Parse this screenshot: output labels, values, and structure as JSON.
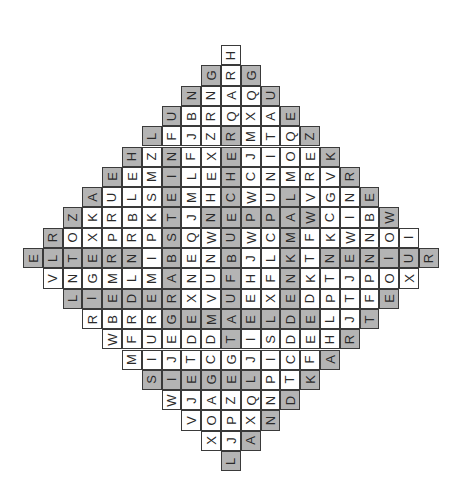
{
  "puzzle": {
    "type": "word-search-diamond",
    "rows": 21,
    "cols": 21,
    "letter_rotation_deg": -90,
    "colors": {
      "cell_bg": "#ffffff",
      "highlight_bg": "#b4b4b4",
      "border": "#3a3a3a",
      "text": "#2a2a2a"
    },
    "grid": [
      {
        "start": 10,
        "letters": "H",
        "hl": [
          0
        ]
      },
      {
        "start": 9,
        "letters": "GRG",
        "hl": [
          1,
          0,
          1
        ]
      },
      {
        "start": 8,
        "letters": "NNAQU",
        "hl": [
          1,
          0,
          0,
          0,
          1
        ]
      },
      {
        "start": 7,
        "letters": "UBRQXAE",
        "hl": [
          1,
          0,
          0,
          0,
          0,
          0,
          1
        ]
      },
      {
        "start": 6,
        "letters": "LFJZRMTQZ",
        "hl": [
          1,
          0,
          0,
          0,
          1,
          0,
          0,
          0,
          1
        ]
      },
      {
        "start": 5,
        "letters": "HZNFXEJIOEK",
        "hl": [
          1,
          0,
          1,
          0,
          0,
          1,
          0,
          0,
          0,
          0,
          1
        ]
      },
      {
        "start": 4,
        "letters": "EEMILEHCNMRVR",
        "hl": [
          1,
          0,
          0,
          1,
          0,
          0,
          1,
          0,
          0,
          0,
          0,
          0,
          1
        ]
      },
      {
        "start": 3,
        "letters": "AULSEMHCWULVGNE",
        "hl": [
          1,
          0,
          0,
          0,
          1,
          0,
          0,
          1,
          0,
          0,
          1,
          0,
          0,
          0,
          1
        ]
      },
      {
        "start": 2,
        "letters": "ZKRBKTJNEPPAWCIBW",
        "hl": [
          1,
          0,
          0,
          0,
          0,
          1,
          0,
          1,
          1,
          1,
          1,
          1,
          1,
          0,
          0,
          0,
          1
        ]
      },
      {
        "start": 1,
        "letters": "ROXPRPSQWUWCMFKWNOI",
        "hl": [
          1,
          0,
          0,
          0,
          0,
          0,
          1,
          0,
          0,
          1,
          0,
          0,
          1,
          0,
          0,
          0,
          0,
          0,
          0
        ]
      },
      {
        "start": 0,
        "letters": "ELTERNIBENBJLKTNENIUR",
        "hl": [
          1,
          1,
          1,
          1,
          1,
          1,
          0,
          1,
          0,
          0,
          1,
          0,
          0,
          1,
          0,
          1,
          1,
          1,
          1,
          1,
          1
        ]
      },
      {
        "start": 1,
        "letters": "VNGMLMANUFHFNKTJPOX",
        "hl": [
          0,
          0,
          0,
          0,
          0,
          0,
          1,
          0,
          0,
          1,
          0,
          0,
          1,
          0,
          0,
          0,
          0,
          0,
          0
        ]
      },
      {
        "start": 2,
        "letters": "LIEDERXVUEXEDPTFE",
        "hl": [
          1,
          1,
          1,
          1,
          1,
          1,
          0,
          0,
          1,
          0,
          0,
          1,
          0,
          0,
          0,
          0,
          1
        ]
      },
      {
        "start": 3,
        "letters": "RBRRGEMAELDELJT",
        "hl": [
          0,
          0,
          0,
          0,
          1,
          1,
          1,
          1,
          1,
          1,
          1,
          1,
          0,
          0,
          1
        ]
      },
      {
        "start": 4,
        "letters": "WFUEDDTISDEHR",
        "hl": [
          0,
          0,
          0,
          0,
          0,
          0,
          1,
          0,
          0,
          0,
          0,
          0,
          1
        ]
      },
      {
        "start": 5,
        "letters": "MIJTCGJICFA",
        "hl": [
          0,
          0,
          0,
          0,
          0,
          0,
          0,
          0,
          0,
          0,
          1
        ]
      },
      {
        "start": 6,
        "letters": "SIEGELPTK",
        "hl": [
          1,
          1,
          1,
          1,
          1,
          1,
          0,
          0,
          1
        ]
      },
      {
        "start": 7,
        "letters": "WJAZQND",
        "hl": [
          0,
          0,
          0,
          0,
          0,
          0,
          1
        ]
      },
      {
        "start": 8,
        "letters": "VOPXN",
        "hl": [
          0,
          0,
          0,
          0,
          1
        ]
      },
      {
        "start": 9,
        "letters": "XJA",
        "hl": [
          0,
          0,
          1
        ]
      },
      {
        "start": 10,
        "letters": "L",
        "hl": [
          1
        ]
      }
    ]
  }
}
